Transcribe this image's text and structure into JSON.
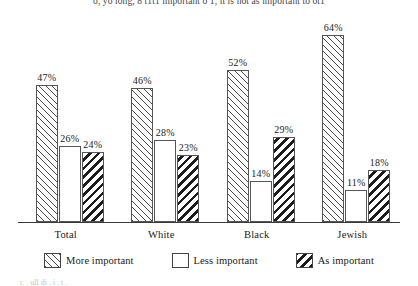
{
  "page": {
    "top_running_text": "o, yo long, 8 t1t1 important o 1, it is not as important to ot1",
    "bottom_running_text": "r.   . ull di  .  i .      t ."
  },
  "chart_data": {
    "type": "bar",
    "title": "",
    "xlabel": "",
    "ylabel": "",
    "ylim": [
      0,
      70
    ],
    "grid": false,
    "legend_position": "bottom",
    "value_suffix": "%",
    "categories": [
      "Total",
      "White",
      "Black",
      "Jewish"
    ],
    "series": [
      {
        "name": "More important",
        "pattern": "diagonal-hatch-forward",
        "values": [
          47,
          46,
          52,
          64
        ],
        "labels": [
          "47%",
          "46%",
          "52%",
          "64%"
        ]
      },
      {
        "name": "Less important",
        "pattern": "solid-white",
        "values": [
          26,
          28,
          14,
          11
        ],
        "labels": [
          "26%",
          "28%",
          "14%",
          "11%"
        ]
      },
      {
        "name": "As important",
        "pattern": "bold-diagonal-hatch-back",
        "values": [
          24,
          23,
          29,
          18
        ],
        "labels": [
          "24%",
          "23%",
          "29%",
          "18%"
        ]
      }
    ]
  },
  "legend": {
    "items": [
      {
        "label": "More important",
        "swatch": "hatch-forward-swatch"
      },
      {
        "label": "Less important",
        "swatch": "empty-swatch"
      },
      {
        "label": "As important",
        "swatch": "hatch-back-swatch"
      }
    ]
  },
  "colors": {
    "axis": "#3a3a3a",
    "bar_outline": "#555555",
    "hatch_light": "#4a4a4a",
    "hatch_dark": "#1c1c1c",
    "background": "#ffffff",
    "text": "#1a1a1a"
  }
}
